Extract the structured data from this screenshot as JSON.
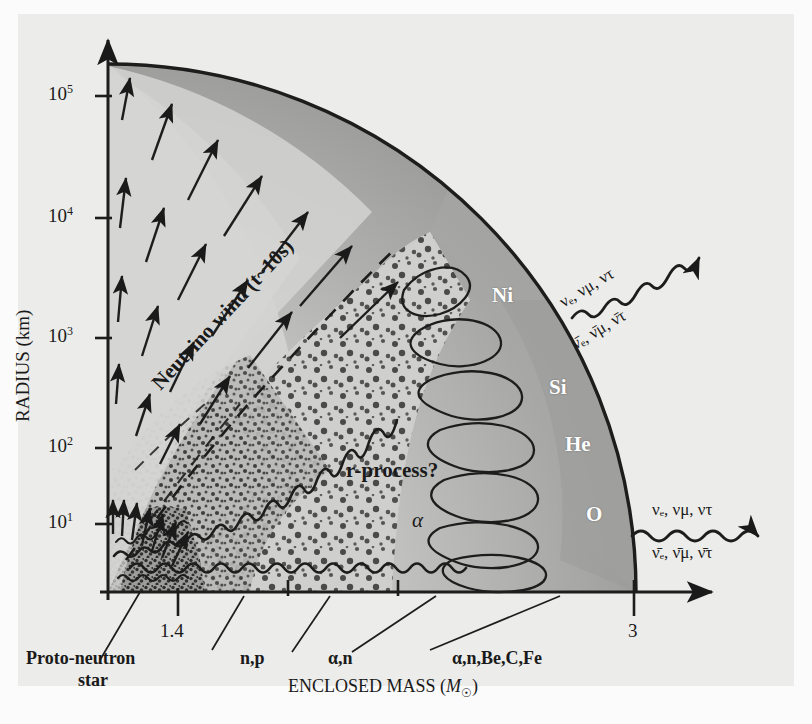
{
  "figure": {
    "title_hidden": "Supernova explosion structure: radius vs enclosed mass",
    "axes": {
      "y_label_text": "RADIUS (km)",
      "y_ticks": [
        {
          "mantissa": "10",
          "exponent": "5",
          "value": 100000
        },
        {
          "mantissa": "10",
          "exponent": "4",
          "value": 10000
        },
        {
          "mantissa": "10",
          "exponent": "3",
          "value": 1000
        },
        {
          "mantissa": "10",
          "exponent": "2",
          "value": 100
        },
        {
          "mantissa": "10",
          "exponent": "1",
          "value": 10
        }
      ],
      "x_label_main": "ENCLOSED MASS (",
      "x_label_symbol": "M",
      "x_label_sub": "☉",
      "x_label_close": ")",
      "x_ticks": [
        {
          "label": "1.4",
          "value": 1.4
        },
        {
          "label": "3",
          "value": 3
        }
      ]
    },
    "annotations": {
      "neutrino_wind": "Neutrino wind (t~10s)",
      "r_process": "r-process?",
      "alpha": "α"
    },
    "shell_labels": [
      {
        "name": "Ni"
      },
      {
        "name": "Si"
      },
      {
        "name": "He"
      },
      {
        "name": "O"
      }
    ],
    "callouts": [
      {
        "id": "proto-neutron-star",
        "line1": "Proto-neutron",
        "line2": "star"
      },
      {
        "id": "np",
        "line1": "n,p"
      },
      {
        "id": "alpha-n",
        "line1": "α,n"
      },
      {
        "id": "alpha-n-be-c-fe",
        "line1": "α,n,Be,C,Fe"
      }
    ],
    "neutrino_streams": [
      {
        "id": "upper",
        "top": "νₑ, νμ, ντ",
        "bottom": "ν̄ₑ, ν̄μ, ν̄τ"
      },
      {
        "id": "lower",
        "top": "νₑ, νμ, ντ",
        "bottom": "ν̄ₑ, ν̄μ, ν̄τ"
      }
    ],
    "colors": {
      "page_background": "#fbfbfb",
      "panel_background": "#ececea",
      "ink": "#1a1a1a",
      "shell_outer": "#9a9a9a",
      "shell_mid": "#b4b4b2",
      "shell_inner": "#c3c3c1",
      "stipple_zone": "#cfcfcd",
      "wind_zone": "#cdcdcb",
      "core_dark": "#8e8e8c",
      "label_white": "#ffffff"
    }
  }
}
